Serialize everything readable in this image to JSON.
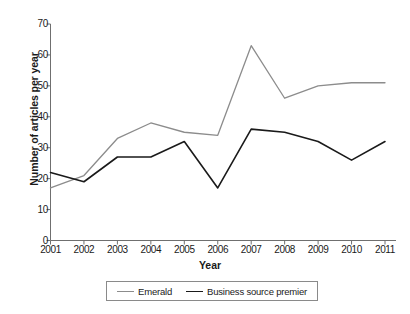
{
  "chart_data": {
    "type": "line",
    "title": "",
    "xlabel": "Year",
    "ylabel": "Number of articles per year",
    "categories": [
      "2001",
      "2002",
      "2003",
      "2004",
      "2005",
      "2006",
      "2007",
      "2008",
      "2009",
      "2010",
      "2011"
    ],
    "x": [
      2001,
      2002,
      2003,
      2004,
      2005,
      2006,
      2007,
      2008,
      2009,
      2010,
      2011
    ],
    "xlim": [
      2001,
      2011
    ],
    "ylim": [
      0,
      70
    ],
    "yticks": [
      0,
      10,
      20,
      30,
      40,
      50,
      60,
      70
    ],
    "ytick_labels": [
      "0",
      "10",
      "20",
      "30",
      "40",
      "50",
      "60",
      "70"
    ],
    "ytick_step": 10,
    "grid": false,
    "legend_position": "bottom",
    "series": [
      {
        "name": "Emerald",
        "color": "#8c8c8c",
        "values": [
          17,
          21,
          33,
          38,
          35,
          34,
          63,
          46,
          50,
          51,
          51
        ]
      },
      {
        "name": "Business source premier",
        "color": "#1a1a1a",
        "values": [
          22,
          19,
          27,
          27,
          32,
          17,
          36,
          35,
          32,
          26,
          32
        ]
      }
    ]
  },
  "axis": {
    "ylabel": "Number of articles per year",
    "xlabel": "Year"
  },
  "legend": {
    "items": [
      {
        "label": "Emerald"
      },
      {
        "label": "Business source premier"
      }
    ]
  }
}
